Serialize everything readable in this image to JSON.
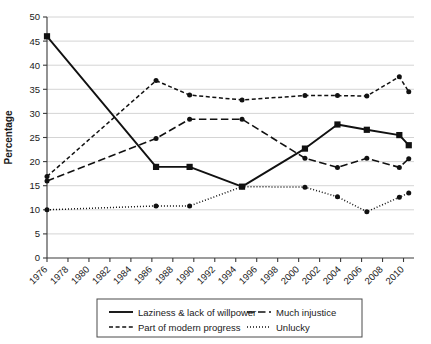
{
  "chart_data": {
    "type": "line",
    "title": "",
    "xlabel": "",
    "ylabel": "Percentage",
    "ylim": [
      0,
      50
    ],
    "ytick_step": 5,
    "yticks": [
      "0",
      "5",
      "10",
      "15",
      "20",
      "25",
      "30",
      "35",
      "40",
      "45",
      "50"
    ],
    "xticks": [
      "1976",
      "1978",
      "1980",
      "1982",
      "1984",
      "1986",
      "1988",
      "1990",
      "1992",
      "1994",
      "1996",
      "1998",
      "2000",
      "2002",
      "2004",
      "2006",
      "2008",
      "2010"
    ],
    "xlim": [
      1976,
      2011
    ],
    "grid": "horizontal",
    "legend_position": "bottom",
    "series": [
      {
        "name": "Laziness & lack of willpower",
        "style": "solid",
        "marker": "square",
        "x": [
          1976,
          1986.4,
          1989.6,
          1994.6,
          2000.6,
          2003.7,
          2006.5,
          2009.6,
          2010.5
        ],
        "values": [
          46.0,
          18.9,
          18.9,
          14.8,
          22.7,
          27.7,
          26.6,
          25.5,
          23.4
        ]
      },
      {
        "name": "Part of modern progress",
        "style": "dashed-short",
        "marker": "circle",
        "x": [
          1976,
          1986.4,
          1989.6,
          1994.6,
          2000.6,
          2003.7,
          2006.5,
          2009.6,
          2010.5
        ],
        "values": [
          16.9,
          36.8,
          33.8,
          32.8,
          33.7,
          33.7,
          33.6,
          37.6,
          34.5
        ]
      },
      {
        "name": "Much injustice",
        "style": "dashed-long",
        "marker": "circle",
        "x": [
          1976,
          1986.4,
          1989.6,
          1994.6,
          2000.6,
          2003.7,
          2006.5,
          2009.6,
          2010.5
        ],
        "values": [
          16.0,
          24.8,
          28.8,
          28.8,
          20.7,
          18.8,
          20.7,
          18.8,
          20.6
        ]
      },
      {
        "name": "Unlucky",
        "style": "dotted",
        "marker": "circle",
        "x": [
          1976,
          1986.4,
          1989.6,
          1994.6,
          2000.6,
          2003.7,
          2006.5,
          2009.6,
          2010.5
        ],
        "values": [
          10.0,
          10.8,
          10.8,
          14.8,
          14.7,
          12.7,
          9.6,
          12.6,
          13.5
        ]
      }
    ]
  },
  "axis": {
    "y_title": "Percentage"
  },
  "legend": {
    "entries": [
      {
        "label": "Laziness & lack of willpower",
        "style": "solid"
      },
      {
        "label": "Much injustice",
        "style": "dashed-long"
      },
      {
        "label": "Part of modern progress",
        "style": "dashed-short"
      },
      {
        "label": "Unlucky",
        "style": "dotted"
      }
    ]
  }
}
